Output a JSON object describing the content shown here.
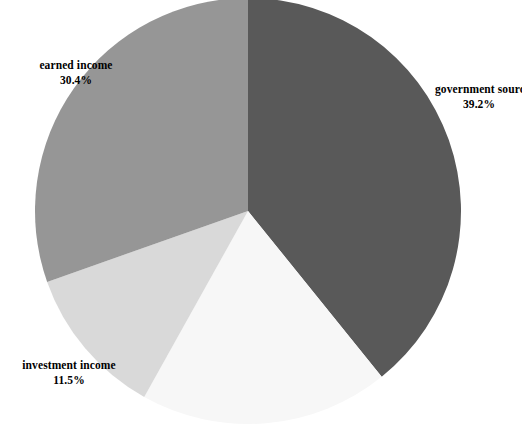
{
  "chart_data": {
    "type": "pie",
    "title": "",
    "subtitle": "",
    "xlabel": "",
    "ylabel": "",
    "grid": false,
    "legend_position": "none",
    "label_format": "name above percent",
    "start_angle_deg_clockwise_from_top": 0,
    "direction": "clockwise",
    "center_px": [
      248,
      211
    ],
    "radius_px": 213,
    "categories": [
      "government sources",
      "unlabeled slice",
      "investment income",
      "earned income"
    ],
    "values": [
      39.2,
      18.9,
      11.5,
      30.4
    ],
    "units": "percent",
    "slices": [
      {
        "name": "government sources",
        "label_text": "government sources",
        "value": 39.2,
        "value_text": "39.2%",
        "color": "#595959",
        "labeled": true,
        "start_angle": 0,
        "end_angle": 141.1
      },
      {
        "name": "unlabeled slice",
        "label_text": "",
        "value": 18.9,
        "value_text": "",
        "color": "#f7f7f7",
        "labeled": false,
        "start_angle": 141.1,
        "end_angle": 209.2
      },
      {
        "name": "investment income",
        "label_text": "investment income",
        "value": 11.5,
        "value_text": "11.5%",
        "color": "#d9d9d9",
        "labeled": true,
        "start_angle": 209.2,
        "end_angle": 250.6
      },
      {
        "name": "earned income",
        "label_text": "earned income",
        "value": 30.4,
        "value_text": "30.4%",
        "color": "#969696",
        "labeled": true,
        "start_angle": 250.6,
        "end_angle": 360
      }
    ]
  },
  "labels": {
    "earned_income": {
      "name": "earned income",
      "percent": "30.4%"
    },
    "government_sources": {
      "name": "government sources",
      "percent": "39.2%"
    },
    "investment_income": {
      "name": "investment income",
      "percent": "11.5%"
    }
  },
  "colors": {
    "government_sources": "#595959",
    "unlabeled": "#f7f7f7",
    "investment_income": "#d9d9d9",
    "earned_income": "#969696",
    "background": "#ffffff",
    "text": "#000000"
  }
}
